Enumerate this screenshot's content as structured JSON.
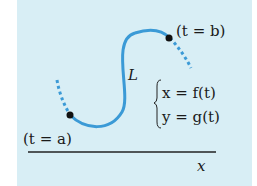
{
  "colors": {
    "background": "#d8eef5",
    "curve": "#3b9ad6",
    "axis": "#222222",
    "point": "#111111"
  },
  "labels": {
    "start_point": "(t = a)",
    "end_point": "(t = b)",
    "curve_name": "L",
    "eq_x": "x = f(t)",
    "eq_y": "y = g(t)",
    "axis_x": "x"
  }
}
